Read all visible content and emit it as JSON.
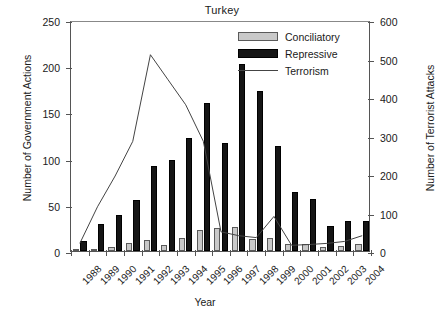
{
  "chart_data": {
    "type": "bar",
    "title": "Turkey",
    "xlabel": "Year",
    "ylabel": "Number of Government Actions",
    "ylabel_right": "Number of Terrorist Attacks",
    "categories": [
      "1988",
      "1989",
      "1990",
      "1991",
      "1992",
      "1993",
      "1994",
      "1995",
      "1996",
      "1997",
      "1998",
      "1999",
      "2000",
      "2001",
      "2002",
      "2003",
      "2004"
    ],
    "ylim": [
      0,
      250
    ],
    "yticks": [
      0,
      50,
      100,
      150,
      200,
      250
    ],
    "ylim_right": [
      0,
      600
    ],
    "yticks_right": [
      0,
      100,
      200,
      300,
      400,
      500,
      600
    ],
    "grid": false,
    "legend_position": "top-right",
    "series": [
      {
        "name": "Conciliatory",
        "type": "bar",
        "color": "#c9c9c9",
        "axis": "left",
        "values": [
          2,
          2,
          4,
          9,
          12,
          6,
          14,
          23,
          25,
          26,
          13,
          14,
          8,
          8,
          4,
          5,
          8
        ]
      },
      {
        "name": "Repressive",
        "type": "bar",
        "color": "#151515",
        "axis": "left",
        "values": [
          11,
          29,
          39,
          55,
          92,
          99,
          122,
          160,
          117,
          202,
          173,
          114,
          64,
          56,
          27,
          33,
          32
        ]
      },
      {
        "name": "Terrorism",
        "type": "line",
        "color": "#444444",
        "axis": "right",
        "values": [
          25,
          120,
          200,
          290,
          515,
          450,
          385,
          290,
          55,
          45,
          40,
          95,
          20,
          22,
          25,
          30,
          45
        ]
      }
    ]
  },
  "legend": {
    "items": [
      {
        "label": "Conciliatory",
        "key": "swatch-gray"
      },
      {
        "label": "Repressive",
        "key": "swatch-black"
      },
      {
        "label": "Terrorism",
        "key": "line-stroke"
      }
    ]
  }
}
